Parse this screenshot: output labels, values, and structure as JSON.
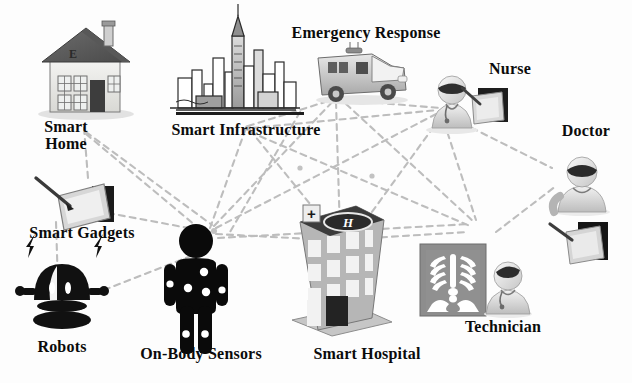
{
  "figure": {
    "background_color": "#fdfdfd",
    "link_color": "#b9b9b9",
    "text_color": "#0b0b0b"
  },
  "nodes": [
    {
      "id": "smart-home",
      "label": "Smart\nHome",
      "icon": "house-icon",
      "label_x": 18,
      "label_y": 118,
      "label_w": 96,
      "label_size": 16
    },
    {
      "id": "smart-infrastructure",
      "label": "Smart Infrastructure",
      "icon": "city-skyline-icon",
      "label_x": 148,
      "label_y": 121,
      "label_w": 196,
      "label_size": 16
    },
    {
      "id": "emergency-response",
      "label": "Emergency Response",
      "icon": "ambulance-icon",
      "label_x": 268,
      "label_y": 24,
      "label_w": 196,
      "label_size": 16
    },
    {
      "id": "nurse",
      "label": "Nurse",
      "icon": "nurse-icon",
      "label_x": 468,
      "label_y": 60,
      "label_w": 84,
      "label_size": 16
    },
    {
      "id": "doctor",
      "label": "Doctor",
      "icon": "doctor-icon",
      "label_x": 540,
      "label_y": 122,
      "label_w": 92,
      "label_size": 16
    },
    {
      "id": "smart-gadgets",
      "label": "Smart Gadgets",
      "icon": "tablet-stylus-icon",
      "label_x": 6,
      "label_y": 224,
      "label_w": 152,
      "label_size": 16
    },
    {
      "id": "robots",
      "label": "Robots",
      "icon": "robot-icon",
      "label_x": 10,
      "label_y": 338,
      "label_w": 104,
      "label_size": 16
    },
    {
      "id": "on-body-sensors",
      "label": "On-Body Sensors",
      "icon": "body-sensor-icon",
      "label_x": 118,
      "label_y": 345,
      "label_w": 166,
      "label_size": 16
    },
    {
      "id": "smart-hospital",
      "label": "Smart Hospital",
      "icon": "hospital-icon",
      "label_x": 292,
      "label_y": 345,
      "label_w": 150,
      "label_size": 16
    },
    {
      "id": "technician",
      "label": "Technician",
      "icon": "xray-technician-icon",
      "label_x": 440,
      "label_y": 318,
      "label_w": 126,
      "label_size": 16
    }
  ],
  "links": [
    {
      "from": "smart-home",
      "to": "hub-left"
    },
    {
      "from": "smart-home",
      "to": "smart-infrastructure"
    },
    {
      "from": "smart-gadgets",
      "to": "on-body-sensors"
    },
    {
      "from": "robots",
      "to": "on-body-sensors"
    },
    {
      "from": "smart-gadgets",
      "to": "robots"
    },
    {
      "from": "on-body-sensors",
      "to": "smart-infrastructure"
    },
    {
      "from": "on-body-sensors",
      "to": "emergency-response"
    },
    {
      "from": "on-body-sensors",
      "to": "nurse"
    },
    {
      "from": "on-body-sensors",
      "to": "smart-hospital"
    },
    {
      "from": "on-body-sensors",
      "to": "technician"
    },
    {
      "from": "smart-infrastructure",
      "to": "emergency-response"
    },
    {
      "from": "smart-infrastructure",
      "to": "smart-hospital"
    },
    {
      "from": "smart-infrastructure",
      "to": "nurse"
    },
    {
      "from": "emergency-response",
      "to": "smart-hospital"
    },
    {
      "from": "emergency-response",
      "to": "nurse"
    },
    {
      "from": "emergency-response",
      "to": "technician"
    },
    {
      "from": "nurse",
      "to": "smart-hospital"
    },
    {
      "from": "nurse",
      "to": "technician"
    },
    {
      "from": "nurse",
      "to": "doctor"
    },
    {
      "from": "smart-hospital",
      "to": "technician"
    },
    {
      "from": "technician",
      "to": "doctor"
    }
  ],
  "icon_details": {
    "hospital_roof_marker": "H",
    "hospital_cross": "+",
    "house_door_letter": "E"
  }
}
